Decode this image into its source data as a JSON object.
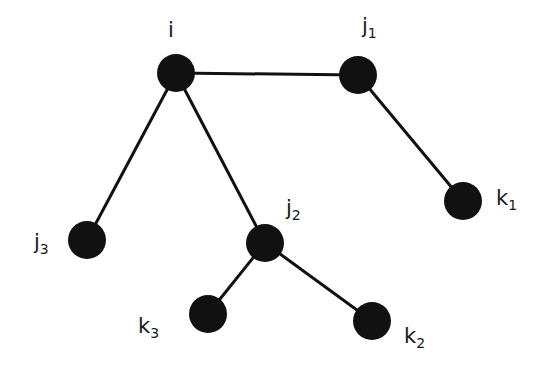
{
  "diagram": {
    "type": "tree-graph",
    "colors": {
      "node": "#111111",
      "edge": "#111111",
      "label": "#1a1a1a",
      "background": "#ffffff"
    },
    "nodes": [
      {
        "id": "i",
        "base": "i",
        "sub": "",
        "x": 176,
        "y": 73,
        "label_x": 168,
        "label_y": 20
      },
      {
        "id": "j1",
        "base": "j",
        "sub": "1",
        "x": 358,
        "y": 75,
        "label_x": 362,
        "label_y": 16
      },
      {
        "id": "k1",
        "base": "k",
        "sub": "1",
        "x": 463,
        "y": 201,
        "label_x": 496,
        "label_y": 188
      },
      {
        "id": "j3",
        "base": "j",
        "sub": "3",
        "x": 87,
        "y": 240,
        "label_x": 34,
        "label_y": 232
      },
      {
        "id": "j2",
        "base": "j",
        "sub": "2",
        "x": 265,
        "y": 243,
        "label_x": 286,
        "label_y": 198
      },
      {
        "id": "k3",
        "base": "k",
        "sub": "3",
        "x": 208,
        "y": 314,
        "label_x": 138,
        "label_y": 316
      },
      {
        "id": "k2",
        "base": "k",
        "sub": "2",
        "x": 372,
        "y": 321,
        "label_x": 404,
        "label_y": 326
      }
    ],
    "edges": [
      {
        "from": "i",
        "to": "j1"
      },
      {
        "from": "j1",
        "to": "k1"
      },
      {
        "from": "i",
        "to": "j3"
      },
      {
        "from": "i",
        "to": "j2"
      },
      {
        "from": "j2",
        "to": "k3"
      },
      {
        "from": "j2",
        "to": "k2"
      }
    ],
    "node_radius": 19,
    "edge_width": 3
  }
}
